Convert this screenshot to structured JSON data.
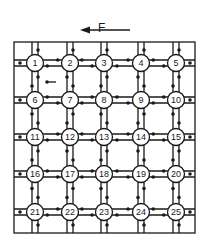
{
  "diagram": {
    "type": "grid-network",
    "force": {
      "label": "F",
      "direction": "left"
    },
    "grid": {
      "rows": 5,
      "cols": 5
    },
    "nodes": [
      {
        "id": "1"
      },
      {
        "id": "2"
      },
      {
        "id": "3"
      },
      {
        "id": "4"
      },
      {
        "id": "5"
      },
      {
        "id": "6"
      },
      {
        "id": "7"
      },
      {
        "id": "8"
      },
      {
        "id": "9"
      },
      {
        "id": "10"
      },
      {
        "id": "11"
      },
      {
        "id": "12"
      },
      {
        "id": "13"
      },
      {
        "id": "14"
      },
      {
        "id": "15"
      },
      {
        "id": "16"
      },
      {
        "id": "17"
      },
      {
        "id": "18"
      },
      {
        "id": "19"
      },
      {
        "id": "20"
      },
      {
        "id": "21"
      },
      {
        "id": "22"
      },
      {
        "id": "23"
      },
      {
        "id": "24"
      },
      {
        "id": "25"
      }
    ],
    "colors": {
      "stroke": "#1a1a1a",
      "background": "#ffffff"
    }
  }
}
